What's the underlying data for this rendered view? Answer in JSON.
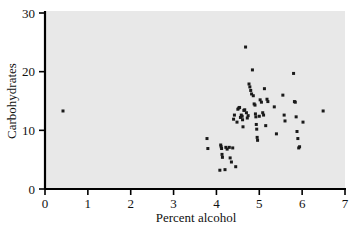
{
  "chart_data": {
    "type": "scatter",
    "title": "",
    "xlabel": "Percent alcohol",
    "ylabel": "Carbohydrates",
    "xlim": [
      0,
      7
    ],
    "ylim": [
      0,
      30
    ],
    "xticks": [
      "0",
      "1",
      "2",
      "3",
      "4",
      "5",
      "6",
      "7"
    ],
    "xtick_values": [
      0,
      1,
      2,
      3,
      4,
      5,
      6,
      7
    ],
    "yticks": [
      "0",
      "10",
      "20",
      "30"
    ],
    "ytick_values": [
      0,
      10,
      20,
      30
    ],
    "grid": false,
    "legend": null,
    "marker": {
      "shape": "square",
      "color": "#1a1a1a",
      "size": 3
    },
    "plot_background": "#e8e8e8",
    "axis_color": "#000000",
    "points": [
      [
        0.42,
        13.3
      ],
      [
        3.78,
        8.6
      ],
      [
        3.8,
        6.9
      ],
      [
        4.08,
        3.2
      ],
      [
        4.1,
        7.5
      ],
      [
        4.11,
        7.2
      ],
      [
        4.12,
        6.9
      ],
      [
        4.13,
        5.9
      ],
      [
        4.14,
        5.4
      ],
      [
        4.2,
        3.3
      ],
      [
        4.22,
        7.1
      ],
      [
        4.25,
        6.8
      ],
      [
        4.3,
        7.1
      ],
      [
        4.32,
        5.3
      ],
      [
        4.35,
        4.6
      ],
      [
        4.38,
        7.0
      ],
      [
        4.4,
        11.9
      ],
      [
        4.42,
        12.6
      ],
      [
        4.45,
        3.8
      ],
      [
        4.48,
        11.4
      ],
      [
        4.5,
        13.6
      ],
      [
        4.52,
        13.8
      ],
      [
        4.54,
        13.9
      ],
      [
        4.56,
        12.2
      ],
      [
        4.58,
        12.6
      ],
      [
        4.6,
        12.4
      ],
      [
        4.61,
        11.8
      ],
      [
        4.62,
        10.6
      ],
      [
        4.64,
        13.4
      ],
      [
        4.66,
        13.5
      ],
      [
        4.68,
        24.2
      ],
      [
        4.7,
        13.0
      ],
      [
        4.72,
        12.1
      ],
      [
        4.74,
        12.5
      ],
      [
        4.76,
        17.9
      ],
      [
        4.78,
        17.4
      ],
      [
        4.8,
        16.8
      ],
      [
        4.82,
        16.2
      ],
      [
        4.84,
        20.3
      ],
      [
        4.86,
        15.9
      ],
      [
        4.88,
        14.5
      ],
      [
        4.9,
        14.3
      ],
      [
        4.91,
        12.8
      ],
      [
        4.92,
        12.3
      ],
      [
        4.93,
        11.0
      ],
      [
        4.94,
        10.2
      ],
      [
        4.95,
        8.8
      ],
      [
        4.96,
        8.3
      ],
      [
        5.0,
        12.4
      ],
      [
        5.02,
        15.2
      ],
      [
        5.05,
        14.8
      ],
      [
        5.08,
        13.0
      ],
      [
        5.1,
        12.6
      ],
      [
        5.12,
        17.1
      ],
      [
        5.15,
        10.8
      ],
      [
        5.18,
        15.3
      ],
      [
        5.2,
        14.9
      ],
      [
        5.35,
        14.0
      ],
      [
        5.4,
        9.4
      ],
      [
        5.55,
        16.0
      ],
      [
        5.58,
        12.6
      ],
      [
        5.6,
        11.6
      ],
      [
        5.8,
        19.7
      ],
      [
        5.82,
        14.9
      ],
      [
        5.84,
        14.8
      ],
      [
        5.86,
        12.3
      ],
      [
        5.88,
        9.8
      ],
      [
        5.9,
        8.6
      ],
      [
        5.92,
        7.0
      ],
      [
        5.94,
        7.2
      ],
      [
        6.02,
        11.4
      ],
      [
        6.49,
        13.3
      ]
    ]
  }
}
